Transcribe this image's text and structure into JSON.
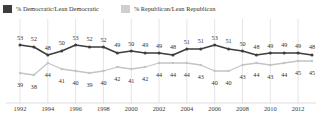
{
  "legend": {
    "democratic": {
      "label": "% Democratic/Lean Democratic",
      "color": "#3d3d3d"
    },
    "republican": {
      "label": "% Republican/Lean Republican",
      "color": "#cfcfcf"
    }
  },
  "axis": {
    "xticks": [
      "1992",
      "1994",
      "1996",
      "1998",
      "2000",
      "2002",
      "2004",
      "2006",
      "2008",
      "2010",
      "2012"
    ]
  },
  "chart_data": {
    "type": "line",
    "title": "",
    "subtitle": "",
    "xlabel": "",
    "ylabel": "",
    "ylim": [
      33,
      58
    ],
    "grid": "vertical-only",
    "legend_position": "top-left",
    "x": [
      1992,
      1993,
      1994,
      1995,
      1996,
      1997,
      1998,
      1999,
      2000,
      2001,
      2002,
      2003,
      2004,
      2005,
      2006,
      2007,
      2008,
      2009,
      2010,
      2011,
      2012,
      2013
    ],
    "categories": [
      "1992",
      "1993",
      "1994",
      "1995",
      "1996",
      "1997",
      "1998",
      "1999",
      "2000",
      "2001",
      "2002",
      "2003",
      "2004",
      "2005",
      "2006",
      "2007",
      "2008",
      "2009",
      "2010",
      "2011",
      "2012",
      "2013"
    ],
    "tick_labels": [
      "1992",
      "1994",
      "1996",
      "1998",
      "2000",
      "2002",
      "2004",
      "2006",
      "2008",
      "2010",
      "2012"
    ],
    "series": [
      {
        "name": "% Democratic/Lean Democratic",
        "color": "#3d3d3d",
        "values": [
          53,
          52,
          48,
          50,
          53,
          52,
          52,
          49,
          50,
          49,
          49,
          48,
          51,
          51,
          53,
          51,
          50,
          48,
          49,
          49,
          49,
          48
        ],
        "label_side": "above"
      },
      {
        "name": "% Republican/Lean Republican",
        "color": "#c4c4c4",
        "values": [
          39,
          38,
          44,
          41,
          40,
          39,
          40,
          42,
          41,
          42,
          44,
          44,
          44,
          43,
          40,
          40,
          43,
          44,
          43,
          44,
          45,
          45
        ],
        "label_side": "below"
      }
    ]
  }
}
